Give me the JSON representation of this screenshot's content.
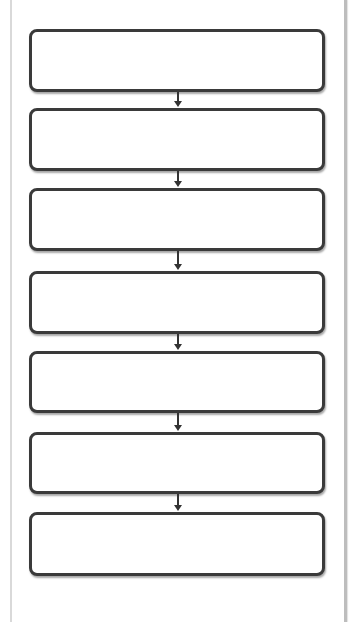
{
  "diagram": {
    "type": "vertical-flowchart",
    "boxes": [
      {
        "id": 1,
        "label": "",
        "top": 29,
        "height": 63
      },
      {
        "id": 2,
        "label": "",
        "top": 108,
        "height": 63
      },
      {
        "id": 3,
        "label": "",
        "top": 188,
        "height": 63
      },
      {
        "id": 4,
        "label": "",
        "top": 271,
        "height": 63
      },
      {
        "id": 5,
        "label": "",
        "top": 351,
        "height": 62
      },
      {
        "id": 6,
        "label": "",
        "top": 432,
        "height": 62
      },
      {
        "id": 7,
        "label": "",
        "top": 512,
        "height": 64
      }
    ],
    "arrows": [
      {
        "from": 1,
        "to": 2,
        "top": 92,
        "length": 16
      },
      {
        "from": 2,
        "to": 3,
        "top": 171,
        "length": 17
      },
      {
        "from": 3,
        "to": 4,
        "top": 251,
        "length": 20
      },
      {
        "from": 4,
        "to": 5,
        "top": 334,
        "length": 17
      },
      {
        "from": 5,
        "to": 6,
        "top": 413,
        "length": 19
      },
      {
        "from": 6,
        "to": 7,
        "top": 494,
        "length": 18
      }
    ],
    "colors": {
      "box_border": "#3a3a3a",
      "box_fill": "#ffffff",
      "arrow": "#333333",
      "frame": "#bdbdbd"
    }
  }
}
